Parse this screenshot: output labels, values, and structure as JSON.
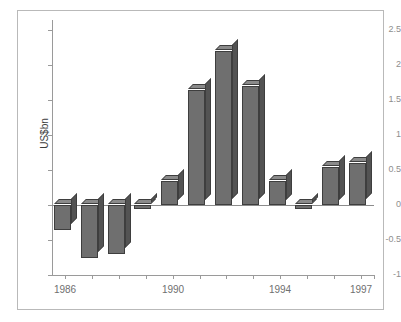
{
  "chart_data": {
    "type": "bar",
    "title": "",
    "xlabel": "",
    "ylabel": "US$bn",
    "ylim": [
      -1,
      2.5
    ],
    "ytick_labels": [
      "2.5",
      "2",
      "1.5",
      "1",
      "0.5",
      "0",
      "-0.5",
      "-1"
    ],
    "ytick_values": [
      2.5,
      2,
      1.5,
      1,
      0.5,
      0,
      -0.5,
      -1
    ],
    "categories": [
      "1986",
      "1987",
      "1988",
      "1989",
      "1990",
      "1991",
      "1992",
      "1993",
      "1994",
      "1995",
      "1996",
      "1997"
    ],
    "xtick_labels_shown": [
      "1986",
      "1990",
      "1994",
      "1997"
    ],
    "values": [
      -0.35,
      -0.75,
      -0.7,
      -0.05,
      0.35,
      1.65,
      2.2,
      1.7,
      0.35,
      -0.05,
      0.55,
      0.6
    ],
    "grid": false,
    "legend": "none",
    "bar_style": "3d",
    "colors": {
      "bar_front": "#6f6f6f",
      "bar_side": "#535353",
      "bar_top": "#8a8a8a",
      "bar_outline": "#3e3e3e",
      "axis": "#9a9a9a",
      "tick_text": "#8e8e8e",
      "category_text": "#6f6f6f",
      "frame": "#b9b9b9",
      "background": "#ffffff"
    }
  }
}
